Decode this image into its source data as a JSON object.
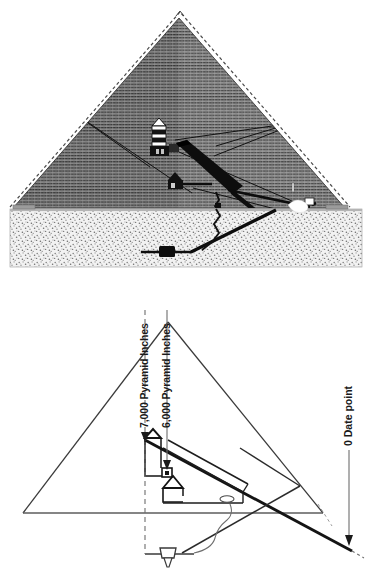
{
  "figure": {
    "panels": [
      {
        "id": "upper-panel",
        "name": "engraved-cross-section",
        "caption": "",
        "style_note": "line-engraving, horizontal course hatching, stippled bedrock"
      },
      {
        "id": "lower-panel",
        "name": "schematic-cross-section",
        "caption": "",
        "style_note": "line schematic with measurement callouts"
      }
    ]
  },
  "upper": {
    "features": [
      {
        "name": "pyramid-outline",
        "label": ""
      },
      {
        "name": "missing-apex-dashed-outline",
        "label": ""
      },
      {
        "name": "kings-chamber",
        "label": ""
      },
      {
        "name": "relieving-chambers",
        "label": ""
      },
      {
        "name": "grand-gallery",
        "label": ""
      },
      {
        "name": "queens-chamber",
        "label": ""
      },
      {
        "name": "ascending-passage",
        "label": ""
      },
      {
        "name": "descending-passage",
        "label": ""
      },
      {
        "name": "well-shaft",
        "label": ""
      },
      {
        "name": "subterranean-chamber",
        "label": ""
      },
      {
        "name": "bedrock",
        "label": ""
      },
      {
        "name": "entrance",
        "label": ""
      },
      {
        "name": "air-shafts",
        "label": ""
      }
    ]
  },
  "lower": {
    "annotations": [
      {
        "id": "pi-7000",
        "name": "pyramid-inches-7000-label",
        "text": "7,000 Pyramid Inches",
        "rotation_deg": -90,
        "marker": "dashed-vertical-line-with-down-arrow"
      },
      {
        "id": "pi-6000",
        "name": "pyramid-inches-6000-label",
        "text": "6,000 Pyramid Inches",
        "rotation_deg": -90,
        "marker": "solid-vertical-line-with-down-arrow"
      },
      {
        "id": "date-point-0",
        "name": "zero-date-point-label",
        "text": "0 Date point",
        "rotation_deg": -90,
        "marker": "solid-vertical-line-with-down-arrow"
      }
    ],
    "features": [
      {
        "name": "pyramid-outline",
        "label": ""
      },
      {
        "name": "base-line",
        "label": ""
      },
      {
        "name": "descending-passage-projection",
        "label": ""
      },
      {
        "name": "grand-gallery",
        "label": ""
      },
      {
        "name": "kings-chamber",
        "label": ""
      },
      {
        "name": "queens-chamber",
        "label": ""
      },
      {
        "name": "antechamber",
        "label": ""
      },
      {
        "name": "well-shaft",
        "label": ""
      },
      {
        "name": "grotto",
        "label": ""
      },
      {
        "name": "subterranean-chamber",
        "label": ""
      },
      {
        "name": "ascending-passage",
        "label": ""
      }
    ]
  },
  "colors": {
    "ink": "#1a1a1a",
    "line": "#2b2b2b",
    "masonry_fill": "#8d8d8d",
    "masonry_hatch": "#3f3f3f",
    "bedrock_fill": "#efefef",
    "bedrock_stipple": "#8a8a8a",
    "chamber_black": "#111111",
    "paper": "#ffffff",
    "light_rule": "#6b6b6b"
  }
}
